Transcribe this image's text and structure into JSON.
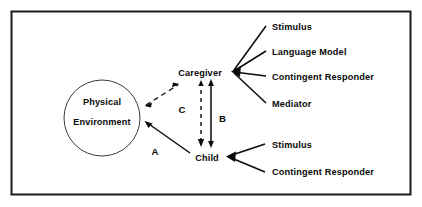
{
  "figure": {
    "frame": {
      "color": "#1a1a1a",
      "x": 11,
      "y": 11,
      "width": 400,
      "height": 184
    },
    "background_color": "#ffffff",
    "line_color": "#0a0a0a"
  },
  "nodes": {
    "environment": {
      "line1": "Physical",
      "line2": "Environment",
      "shape": "circle",
      "cx": 102,
      "cy": 118,
      "r": 38
    },
    "caregiver": {
      "label": "Caregiver",
      "x": 200,
      "y": 73
    },
    "child": {
      "label": "Child",
      "x": 207,
      "y": 158
    }
  },
  "caregiver_attributes": [
    {
      "label": "Stimulus",
      "x": 273,
      "y": 30
    },
    {
      "label": "Language Model",
      "x": 273,
      "y": 55
    },
    {
      "label": "Contingent Responder",
      "x": 273,
      "y": 80
    },
    {
      "label": "Mediator",
      "x": 273,
      "y": 107
    }
  ],
  "child_attributes": [
    {
      "label": "Stimulus",
      "x": 273,
      "y": 148
    },
    {
      "label": "Contingent Responder",
      "x": 273,
      "y": 175
    }
  ],
  "path_labels": [
    {
      "label": "A",
      "x": 155,
      "y": 152,
      "style": "solid",
      "from": "environment",
      "to": "child"
    },
    {
      "label": "B",
      "x": 215,
      "y": 120,
      "style": "solid",
      "from": "child",
      "to": "caregiver"
    },
    {
      "label": "C",
      "x": 182,
      "y": 110,
      "style": "dashed",
      "from": "environment",
      "to": "caregiver"
    }
  ]
}
